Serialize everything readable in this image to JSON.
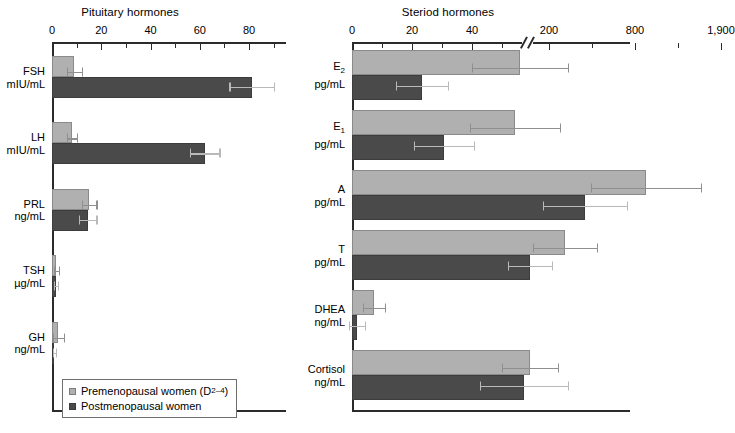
{
  "chart_data": [
    {
      "type": "bar",
      "orientation": "horizontal",
      "title": "Pituitary hormones",
      "xlabel": "",
      "ylabel": "",
      "xlim": [
        0,
        95
      ],
      "xticks": [
        0,
        10,
        20,
        30,
        40,
        50,
        60,
        70,
        80,
        90
      ],
      "xticklabels": [
        "0",
        "",
        "20",
        "",
        "40",
        "",
        "60",
        "",
        "80",
        ""
      ],
      "grid": false,
      "axis_break": false,
      "legend_position": "bottom-left",
      "categories": [
        "FSH",
        "LH",
        "PRL",
        "TSH",
        "GH"
      ],
      "category_units": [
        "mIU/mL",
        "mIU/mL",
        "ng/mL",
        "µg/mL",
        "ng/mL"
      ],
      "series": [
        {
          "name": "Premenopausal women (D2-4)",
          "color": "#b0b0b0",
          "values": [
            9.0,
            8.0,
            15.0,
            1.8,
            2.5
          ],
          "errors": [
            3.0,
            2.0,
            3.0,
            0.9,
            2.2
          ]
        },
        {
          "name": "Postmenopausal women",
          "color": "#4a4a4a",
          "values": [
            81.0,
            62.0,
            14.5,
            1.5,
            1.0
          ],
          "errors": [
            9.0,
            6.0,
            3.5,
            0.8,
            0.6
          ]
        }
      ]
    },
    {
      "type": "bar",
      "orientation": "horizontal",
      "title": "Steriod hormones",
      "xlabel": "",
      "ylabel": "",
      "xticklabels": [
        "0",
        "20",
        "40",
        "200",
        "800",
        "1,900"
      ],
      "grid": false,
      "axis_break": true,
      "axis_break_note": "scale break between 40 and 200",
      "categories": [
        "E2",
        "E1",
        "A",
        "T",
        "DHEA",
        "Cortisol"
      ],
      "category_units": [
        "pg/mL",
        "pg/mL",
        "pg/mL",
        "pg/mL",
        "ng/mL",
        "ng/mL"
      ],
      "series": [
        {
          "name": "Premenopausal women (D2-4)",
          "color": "#b0b0b0",
          "values": [
            140,
            135,
            1900,
            320,
            7,
            250
          ],
          "errors": [
            45,
            40,
            560,
            75,
            2.5,
            55
          ]
        },
        {
          "name": "Postmenopausal women",
          "color": "#4a4a4a",
          "values": [
            16,
            30,
            700,
            230,
            1.2,
            230
          ],
          "errors": [
            6,
            9,
            180,
            55,
            0.8,
            70
          ]
        }
      ]
    }
  ],
  "panels": {
    "left": {
      "title": "Pituitary hormones",
      "ticks": [
        {
          "label": "0",
          "value": 0,
          "major": true
        },
        {
          "label": "",
          "value": 10,
          "major": false
        },
        {
          "label": "20",
          "value": 20,
          "major": true
        },
        {
          "label": "",
          "value": 30,
          "major": false
        },
        {
          "label": "40",
          "value": 40,
          "major": true
        },
        {
          "label": "",
          "value": 50,
          "major": false
        },
        {
          "label": "60",
          "value": 60,
          "major": true
        },
        {
          "label": "",
          "value": 70,
          "major": false
        },
        {
          "label": "80",
          "value": 80,
          "major": true
        },
        {
          "label": "",
          "value": 90,
          "major": false
        }
      ],
      "groups": [
        {
          "name": "FSH",
          "unit": "mIU/mL",
          "pre": 9.0,
          "pre_err": 3.0,
          "post": 81.0,
          "post_err": 9.0
        },
        {
          "name": "LH",
          "unit": "mIU/mL",
          "pre": 8.0,
          "pre_err": 2.0,
          "post": 62.0,
          "post_err": 6.0
        },
        {
          "name": "PRL",
          "unit": "ng/mL",
          "pre": 15.0,
          "pre_err": 3.0,
          "post": 14.5,
          "post_err": 3.5
        },
        {
          "name": "TSH",
          "unit": "µg/mL",
          "pre": 1.8,
          "pre_err": 0.9,
          "post": 1.5,
          "post_err": 0.8
        },
        {
          "name": "GH",
          "unit": "ng/mL",
          "pre": 2.5,
          "pre_err": 2.2,
          "post": 1.0,
          "post_err": 0.6
        }
      ]
    },
    "right": {
      "title": "Steriod hormones",
      "ticks": [
        {
          "label": "0",
          "px": 0,
          "major": true
        },
        {
          "label": "",
          "px": 30,
          "major": false
        },
        {
          "label": "20",
          "px": 60,
          "major": true
        },
        {
          "label": "",
          "px": 90,
          "major": false
        },
        {
          "label": "40",
          "px": 120,
          "major": true
        },
        {
          "label": "",
          "px": 150,
          "major": false
        },
        {
          "label": "200",
          "px": 197,
          "major": true
        },
        {
          "label": "",
          "px": 240,
          "major": false
        },
        {
          "label": "800",
          "px": 283,
          "major": true
        },
        {
          "label": "",
          "px": 326,
          "major": false
        },
        {
          "label": "1,900",
          "px": 369,
          "major": true
        }
      ],
      "groups": [
        {
          "name": "E2",
          "sub": "2",
          "unit": "pg/mL",
          "pre_px": 168,
          "pre_err_px": 48,
          "post_px": 70,
          "post_err_px": 26
        },
        {
          "name": "E1",
          "sub": "1",
          "unit": "pg/mL",
          "pre_px": 163,
          "pre_err_px": 45,
          "post_px": 92,
          "post_err_px": 30
        },
        {
          "name": "A",
          "sub": "",
          "unit": "pg/mL",
          "pre_px": 294,
          "pre_err_px": 55,
          "post_px": 233,
          "post_err_px": 42
        },
        {
          "name": "T",
          "sub": "",
          "unit": "pg/mL",
          "pre_px": 213,
          "pre_err_px": 32,
          "post_px": 178,
          "post_err_px": 22
        },
        {
          "name": "DHEA",
          "sub": "",
          "unit": "ng/mL",
          "pre_px": 22,
          "pre_err_px": 11,
          "post_px": 5,
          "post_err_px": 8
        },
        {
          "name": "Cortisol",
          "sub": "",
          "unit": "ng/mL",
          "pre_px": 178,
          "pre_err_px": 28,
          "post_px": 172,
          "post_err_px": 44
        }
      ]
    }
  },
  "legend": {
    "premenopausal": "Premenopausal women (D",
    "premenopausal_sub": "2–4",
    "premenopausal_tail": ")",
    "postmenopausal": "Postmenopausal women"
  }
}
